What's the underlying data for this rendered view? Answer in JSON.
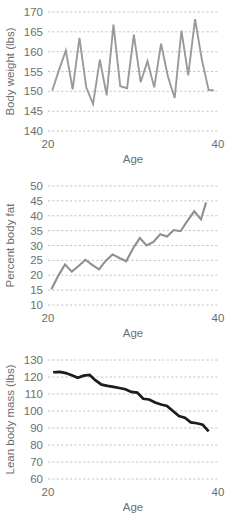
{
  "figure": {
    "background": "#ffffff",
    "panel_count": 3
  },
  "chart_data": [
    {
      "type": "line",
      "title": "",
      "xlabel": "Age",
      "ylabel": "Body weight (lbs)",
      "xlim": [
        20,
        40
      ],
      "ylim": [
        140,
        170
      ],
      "xticks": [
        20,
        40
      ],
      "xticklabels": [
        "20",
        "40"
      ],
      "yticks": [
        140,
        145,
        150,
        155,
        160,
        165,
        170
      ],
      "yticklabels": [
        "140",
        "145",
        "150",
        "155",
        "160",
        "165",
        "170"
      ],
      "grid": true,
      "grid_axis": "y",
      "legend": false,
      "line_color": "#9a9a9a",
      "line_width": 1.9,
      "x": [
        20.5,
        21.3,
        22.1,
        22.9,
        23.7,
        24.5,
        25.3,
        26.1,
        26.9,
        27.7,
        28.5,
        29.3,
        30.1,
        30.9,
        31.7,
        32.5,
        33.3,
        34.1,
        34.9,
        35.7,
        36.5,
        37.3,
        38.1,
        38.9,
        39.5
      ],
      "y": [
        150.2,
        155.4,
        160.3,
        150.5,
        163.5,
        151.0,
        146.8,
        158.0,
        149.0,
        166.8,
        151.3,
        150.8,
        164.3,
        152.3,
        157.6,
        151.0,
        162.0,
        153.8,
        148.3,
        165.3,
        154.0,
        168.2,
        158.0,
        150.3,
        150.3
      ]
    },
    {
      "type": "line",
      "title": "",
      "xlabel": "Age",
      "ylabel": "Percent body fat",
      "xlim": [
        20,
        40
      ],
      "ylim": [
        10,
        50
      ],
      "xticks": [
        20,
        40
      ],
      "xticklabels": [
        "20",
        "40"
      ],
      "yticks": [
        10,
        15,
        20,
        25,
        30,
        35,
        40,
        45,
        50
      ],
      "yticklabels": [
        "10",
        "15",
        "20",
        "25",
        "30",
        "35",
        "40",
        "45",
        "50"
      ],
      "grid": true,
      "grid_axis": "y",
      "legend": false,
      "line_color": "#8f8f8f",
      "line_width": 2.1,
      "x": [
        20.4,
        21.2,
        22.0,
        22.8,
        23.6,
        24.4,
        25.2,
        26.0,
        26.8,
        27.6,
        28.4,
        29.2,
        30.0,
        30.8,
        31.6,
        32.4,
        33.2,
        34.0,
        34.8,
        35.6,
        36.4,
        37.2,
        38.0,
        38.6
      ],
      "y": [
        15.3,
        19.8,
        23.6,
        21.2,
        23.1,
        25.2,
        23.5,
        22.0,
        24.9,
        27.0,
        25.8,
        24.7,
        29.0,
        32.5,
        30.0,
        31.2,
        33.8,
        33.0,
        35.2,
        34.8,
        38.3,
        41.5,
        38.8,
        44.5,
        42.6
      ]
    },
    {
      "type": "line",
      "title": "",
      "xlabel": "Age",
      "ylabel": "Lean body mass (lbs)",
      "xlim": [
        20,
        40
      ],
      "ylim": [
        60,
        130
      ],
      "xticks": [
        20,
        40
      ],
      "xticklabels": [
        "20",
        "40"
      ],
      "yticks": [
        60,
        70,
        80,
        90,
        100,
        110,
        120,
        130
      ],
      "yticklabels": [
        "60",
        "70",
        "80",
        "90",
        "100",
        "110",
        "120",
        "130"
      ],
      "grid": true,
      "grid_axis": "y",
      "legend": false,
      "line_color": "#1c1c1c",
      "line_width": 2.7,
      "x": [
        20.6,
        21.4,
        22.1,
        22.8,
        23.5,
        24.2,
        24.9,
        25.6,
        26.3,
        27.0,
        27.7,
        28.4,
        29.1,
        29.8,
        30.5,
        31.2,
        31.9,
        32.6,
        33.3,
        34.0,
        34.7,
        35.4,
        36.1,
        36.8,
        37.5,
        38.2,
        38.9
      ],
      "y": [
        122.8,
        123.0,
        122.3,
        121.0,
        119.5,
        120.8,
        121.2,
        118.0,
        115.5,
        114.8,
        114.2,
        113.5,
        112.8,
        111.2,
        110.8,
        107.2,
        106.8,
        105.0,
        103.8,
        103.0,
        100.0,
        97.0,
        96.0,
        93.3,
        92.8,
        92.0,
        88.0
      ]
    }
  ]
}
